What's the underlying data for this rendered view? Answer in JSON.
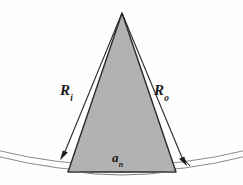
{
  "figure": {
    "type": "technical-geometry-diagram",
    "background_color": "#fefefe",
    "sector_fill_color": "#b2b2b2",
    "stroke_color": "#1a1a1a",
    "arc_stroke_color": "#555555"
  },
  "labels": {
    "inner_radius": {
      "symbol": "R",
      "subscript": "i",
      "full": "Ri"
    },
    "outer_radius": {
      "symbol": "R",
      "subscript": "o",
      "full": "Ro"
    },
    "arc_width": {
      "symbol": "a",
      "subscript": "n",
      "full": "an"
    }
  },
  "geometry": {
    "apex": {
      "x": 122,
      "y": 12
    },
    "base_left": {
      "x": 68,
      "y": 172
    },
    "base_right": {
      "x": 176,
      "y": 172
    },
    "inner_arrow_tip": {
      "x": 61,
      "y": 158
    },
    "outer_arrow_tip": {
      "x": 186,
      "y": 164
    },
    "arc_inner_left": {
      "x": 0,
      "y": 157
    },
    "arc_inner_right": {
      "x": 243,
      "y": 157
    },
    "arc_outer_left": {
      "x": 0,
      "y": 163
    },
    "arc_outer_right": {
      "x": 243,
      "y": 163
    }
  }
}
